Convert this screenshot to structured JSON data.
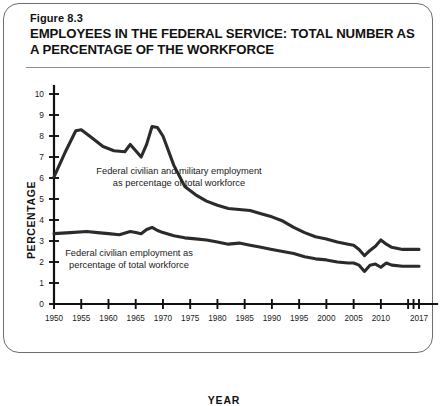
{
  "figure": {
    "number": "Figure 8.3",
    "title": "EMPLOYEES IN THE FEDERAL SERVICE: TOTAL NUMBER AS A PERCENTAGE OF THE WORKFORCE"
  },
  "axis": {
    "ylabel": "PERCENTAGE",
    "xlabel": "YEAR"
  },
  "chart_data": {
    "type": "line",
    "title": "EMPLOYEES IN THE FEDERAL SERVICE: TOTAL NUMBER AS A PERCENTAGE OF THE WORKFORCE",
    "subtitle": "Figure 8.3",
    "xlabel": "YEAR",
    "ylabel": "PERCENTAGE",
    "xlim": [
      1950,
      2017
    ],
    "ylim": [
      0,
      10
    ],
    "yticks": [
      0,
      1,
      2,
      3,
      4,
      5,
      6,
      7,
      8,
      9,
      10
    ],
    "ytick_labels": [
      "0",
      "1",
      "2",
      "3",
      "4",
      "5",
      "6",
      "7",
      "8",
      "9",
      "10"
    ],
    "xticks": [
      1950,
      1955,
      1960,
      1965,
      1970,
      1975,
      1980,
      1985,
      1990,
      1995,
      2000,
      2005,
      2010,
      2017
    ],
    "xtick_labels": [
      "1950",
      "1955",
      "1960",
      "1965",
      "1970",
      "1975",
      "1980",
      "1985",
      "1990",
      "1995",
      "2000",
      "2005",
      "2010",
      "2017"
    ],
    "grid": false,
    "legend_position": "inline-annotations",
    "line_color": "#2b2b2b",
    "series": [
      {
        "name": "Federal civilian and military employment as percentage of total workforce",
        "annotation": "Federal civilian and military employment\nas percentage of total workforce",
        "x": [
          1950,
          1952,
          1954,
          1955,
          1957,
          1959,
          1961,
          1963,
          1964,
          1965,
          1966,
          1967,
          1968,
          1969,
          1970,
          1972,
          1974,
          1976,
          1978,
          1980,
          1982,
          1984,
          1986,
          1988,
          1990,
          1992,
          1994,
          1996,
          1998,
          2000,
          2002,
          2004,
          2005,
          2006,
          2007,
          2008,
          2009,
          2010,
          2011,
          2012,
          2014,
          2016,
          2017
        ],
        "y": [
          6.05,
          7.2,
          8.25,
          8.3,
          7.9,
          7.5,
          7.3,
          7.25,
          7.6,
          7.3,
          7.0,
          7.6,
          8.45,
          8.4,
          8.0,
          6.6,
          5.6,
          5.2,
          4.9,
          4.7,
          4.55,
          4.5,
          4.45,
          4.3,
          4.15,
          3.95,
          3.65,
          3.4,
          3.2,
          3.1,
          2.95,
          2.85,
          2.8,
          2.6,
          2.3,
          2.55,
          2.75,
          3.05,
          2.85,
          2.7,
          2.6,
          2.6,
          2.6
        ]
      },
      {
        "name": "Federal civilian employment as percentage of total workforce",
        "annotation": "Federal civilian employment as\npercentage of total workforce",
        "x": [
          1950,
          1953,
          1956,
          1958,
          1960,
          1962,
          1964,
          1965,
          1966,
          1967,
          1968,
          1969,
          1970,
          1972,
          1974,
          1976,
          1978,
          1980,
          1982,
          1984,
          1986,
          1988,
          1990,
          1992,
          1994,
          1996,
          1998,
          2000,
          2002,
          2004,
          2005,
          2006,
          2007,
          2008,
          2009,
          2010,
          2011,
          2012,
          2014,
          2016,
          2017
        ],
        "y": [
          3.35,
          3.4,
          3.45,
          3.4,
          3.35,
          3.3,
          3.45,
          3.4,
          3.35,
          3.55,
          3.65,
          3.5,
          3.4,
          3.25,
          3.15,
          3.1,
          3.05,
          2.95,
          2.85,
          2.9,
          2.8,
          2.7,
          2.6,
          2.5,
          2.4,
          2.25,
          2.15,
          2.1,
          2.0,
          1.95,
          1.95,
          1.85,
          1.55,
          1.85,
          1.9,
          1.75,
          1.95,
          1.85,
          1.8,
          1.8,
          1.8
        ]
      }
    ]
  }
}
